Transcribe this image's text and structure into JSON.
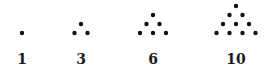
{
  "figures": [
    {
      "label": "1",
      "rows": 1
    },
    {
      "label": "3",
      "rows": 2
    },
    {
      "label": "6",
      "rows": 3
    },
    {
      "label": "10",
      "rows": 4
    }
  ],
  "colors": {
    "dot": "#111111",
    "label": "#1a1a1a",
    "background": "#ffffff"
  }
}
